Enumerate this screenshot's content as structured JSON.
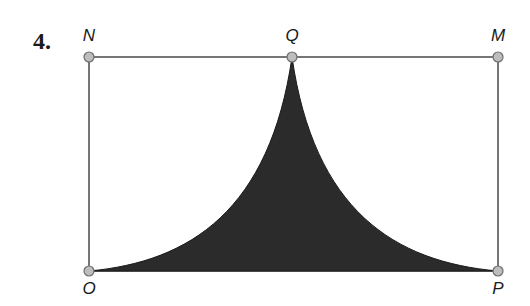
{
  "problem": {
    "number": "4."
  },
  "points": {
    "N": {
      "label": "N",
      "x": 89,
      "y": 57
    },
    "Q": {
      "label": "Q",
      "x": 292,
      "y": 57
    },
    "M": {
      "label": "M",
      "x": 498,
      "y": 57
    },
    "O": {
      "label": "O",
      "x": 89,
      "y": 271
    },
    "P": {
      "label": "P",
      "x": 498,
      "y": 271
    }
  },
  "colors": {
    "line": "#4a4a4a",
    "shade": "#2b2b2b",
    "point_fill": "#bdbdbd",
    "point_stroke": "#6e6e6e"
  }
}
